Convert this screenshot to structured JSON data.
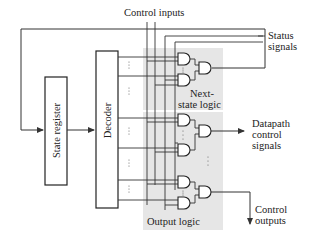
{
  "diagram": {
    "labels": {
      "control_inputs": "Control inputs",
      "status_line1": "Status",
      "status_line2": "signals",
      "state_register": "State register",
      "decoder": "Decoder",
      "next_state_line1": "Next-",
      "next_state_line2": "state logic",
      "datapath_line1": "Datapath",
      "datapath_line2": "control",
      "datapath_line3": "signals",
      "control_outputs_line1": "Control",
      "control_outputs_line2": "outputs",
      "output_logic": "Output logic"
    },
    "blocks": [
      {
        "id": "state-register",
        "label": "State register"
      },
      {
        "id": "decoder",
        "label": "Decoder"
      },
      {
        "id": "next-state-logic",
        "label": "Next-state logic",
        "gates": [
          "AND",
          "AND",
          "OR"
        ]
      },
      {
        "id": "output-logic",
        "label": "Output logic",
        "gates": [
          "AND",
          "AND",
          "OR",
          "AND",
          "AND",
          "OR"
        ]
      }
    ],
    "ellipsis": "⋮",
    "colors": {
      "line": "#333333",
      "shade": "#e6e6e6",
      "box_border": "#222222"
    }
  }
}
